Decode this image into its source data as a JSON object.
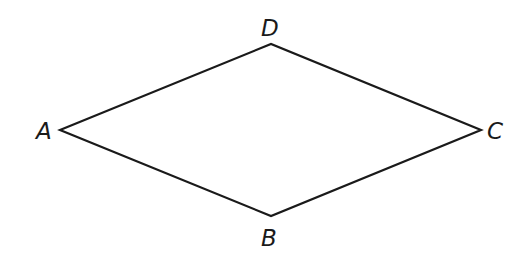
{
  "diagram": {
    "type": "rhombus",
    "stroke_color": "#1a1a1a",
    "stroke_width": 2.2,
    "vertices": {
      "A": {
        "label": "A",
        "x": 60,
        "y": 130
      },
      "D": {
        "label": "D",
        "x": 271,
        "y": 44
      },
      "C": {
        "label": "C",
        "x": 481,
        "y": 130
      },
      "B": {
        "label": "B",
        "x": 271,
        "y": 216
      }
    },
    "edges": [
      [
        "A",
        "D"
      ],
      [
        "D",
        "C"
      ],
      [
        "C",
        "B"
      ],
      [
        "B",
        "A"
      ]
    ]
  }
}
